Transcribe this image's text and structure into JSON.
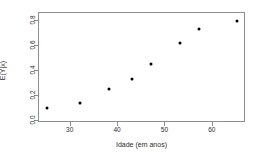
{
  "chart_data": {
    "type": "scatter",
    "title": "",
    "xlabel": "Idade (em anos)",
    "ylabel": "E(Y|x)",
    "x": [
      25,
      32,
      38,
      43,
      47,
      53,
      57,
      65
    ],
    "y": [
      0.1,
      0.14,
      0.25,
      0.33,
      0.45,
      0.62,
      0.73,
      0.8
    ],
    "points": [
      {
        "x": 25,
        "y": 0.1
      },
      {
        "x": 32,
        "y": 0.14
      },
      {
        "x": 38,
        "y": 0.25
      },
      {
        "x": 43,
        "y": 0.33
      },
      {
        "x": 47,
        "y": 0.45
      },
      {
        "x": 53,
        "y": 0.62
      },
      {
        "x": 57,
        "y": 0.73
      },
      {
        "x": 65,
        "y": 0.8
      }
    ],
    "xlim": [
      23.3,
      67.0
    ],
    "ylim": [
      -0.02,
      0.86
    ],
    "xticks": [
      30,
      40,
      50,
      60
    ],
    "xtick_labels": [
      "30",
      "40",
      "50",
      "60"
    ],
    "yticks": [
      0.0,
      0.2,
      0.4,
      0.6,
      0.8
    ],
    "ytick_labels": [
      "0.0",
      "0.2",
      "0.4",
      "0.6",
      "0.8"
    ],
    "grid": false,
    "legend": null,
    "marker": "filled-circle",
    "marker_color": "#000000",
    "frame_color": "#8d8d8d",
    "background": "#ffffff"
  }
}
